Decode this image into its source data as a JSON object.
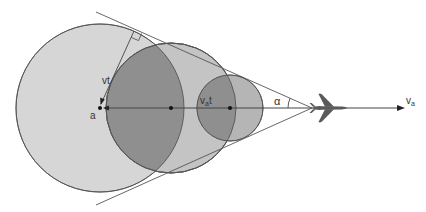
{
  "diagram": {
    "labels": {
      "vt": "vt",
      "a": "a",
      "vat_main": "v",
      "vat_sub": "a",
      "vat_tail": "t",
      "alpha": "α",
      "va_main": "v",
      "va_sub": "a"
    },
    "colors": {
      "large_circle_fill": "#d6d6d6",
      "mid_circle_fill": "#c2c2c2",
      "small_circle_fill": "#b3b3b3",
      "overlap_fill": "#8f8f8f",
      "stroke": "#555555",
      "airplane": "#5a5a5a",
      "background": "#ffffff"
    },
    "geometry": {
      "axis_y": 108,
      "large_circle": {
        "cx": 100,
        "cy": 108,
        "r": 84
      },
      "mid_circle": {
        "cx": 171,
        "cy": 108,
        "r": 65
      },
      "small_circle": {
        "cx": 230,
        "cy": 108,
        "r": 33
      },
      "apex": {
        "x": 312,
        "y": 108
      },
      "velocity_arrow_end": {
        "x": 404,
        "y": 108
      }
    }
  }
}
